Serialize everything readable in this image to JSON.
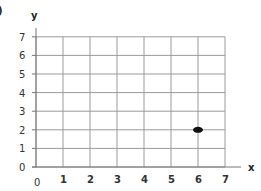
{
  "corner_label": ")",
  "chart_data": {
    "type": "scatter",
    "title": "",
    "xlabel": "x",
    "ylabel": "y",
    "xlim": [
      0,
      7
    ],
    "ylim": [
      0,
      7
    ],
    "grid": true,
    "x_ticks": [
      "0",
      "1",
      "2",
      "3",
      "4",
      "5",
      "6",
      "7"
    ],
    "y_ticks": [
      "0",
      "1",
      "2",
      "3",
      "4",
      "5",
      "6",
      "7"
    ],
    "series": [
      {
        "name": "point",
        "points": [
          {
            "x": 6,
            "y": 2
          }
        ],
        "color": "#111111"
      }
    ]
  }
}
